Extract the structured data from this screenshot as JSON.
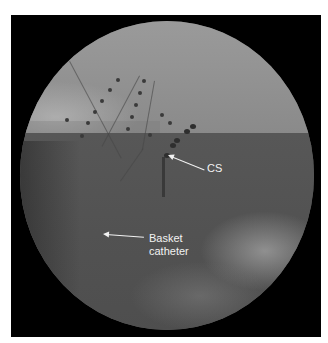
{
  "image": {
    "type": "fluoroscopy",
    "background_color": "#ffffff",
    "frame_color": "#000000",
    "annotation_color": "#f2f2f2"
  },
  "annotations": [
    {
      "id": "cs",
      "text": "CS",
      "label_x": 204,
      "label_y": 163,
      "arrow_tip_x": 169,
      "arrow_tip_y": 155
    },
    {
      "id": "basket",
      "lines": [
        "Basket",
        "catheter"
      ],
      "label_x": 149,
      "label_y": 235,
      "arrow_tip_x": 104,
      "arrow_tip_y": 235
    }
  ]
}
